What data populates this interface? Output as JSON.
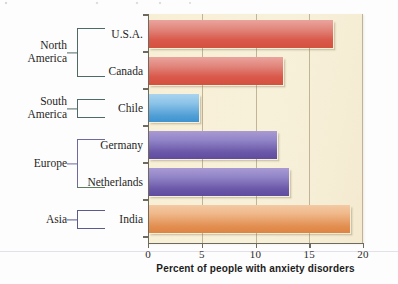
{
  "chart_data": {
    "type": "bar",
    "orientation": "horizontal",
    "title": "",
    "xlabel": "Percent of people with anxiety disorders",
    "ylabel": "",
    "xlim": [
      0,
      20
    ],
    "xticks": [
      0,
      5,
      10,
      15,
      20
    ],
    "xtick_labels": [
      "0",
      "5",
      "10",
      "15",
      "20"
    ],
    "grid": true,
    "grid_axis": "x",
    "legend": "none",
    "plot_background": "#f7efd5",
    "categories": [
      "U.S.A.",
      "Canada",
      "Chile",
      "Germany",
      "Netherlands",
      "India"
    ],
    "values": [
      17.2,
      12.6,
      4.7,
      12.0,
      13.1,
      18.8
    ],
    "bars": [
      {
        "label": "U.S.A.",
        "value": 17.2,
        "region": "North America",
        "color": "#d9584a"
      },
      {
        "label": "Canada",
        "value": 12.6,
        "region": "North America",
        "color": "#d9584a"
      },
      {
        "label": "Chile",
        "value": 4.7,
        "region": "South America",
        "color": "#4f9ed6"
      },
      {
        "label": "Germany",
        "value": 12.0,
        "region": "Europe",
        "color": "#6a57a8"
      },
      {
        "label": "Netherlands",
        "value": 13.1,
        "region": "Europe",
        "color": "#6a57a8"
      },
      {
        "label": "India",
        "value": 18.8,
        "region": "Asia",
        "color": "#e28f51"
      }
    ],
    "regions": [
      {
        "name": "North America",
        "line1": "North",
        "line2": "America",
        "members": [
          "U.S.A.",
          "Canada"
        ],
        "bracket_color": "#4e6a66"
      },
      {
        "name": "South America",
        "line1": "South",
        "line2": "America",
        "members": [
          "Chile"
        ],
        "bracket_color": "#4e6a66"
      },
      {
        "name": "Europe",
        "line1": "Europe",
        "line2": "",
        "members": [
          "Germany",
          "Netherlands"
        ],
        "bracket_color": "#6f6a9e"
      },
      {
        "name": "Asia",
        "line1": "Asia",
        "line2": "",
        "members": [
          "India"
        ],
        "bracket_color": "#5a5a8c"
      }
    ]
  },
  "axis": {
    "tick_0": "0",
    "tick_5": "5",
    "tick_10": "10",
    "tick_15": "15",
    "tick_20": "20",
    "title": "Percent of people with anxiety disorders"
  },
  "labels": {
    "usa": "U.S.A.",
    "canada": "Canada",
    "chile": "Chile",
    "germany": "Germany",
    "netherlands": "Netherlands",
    "india": "India"
  },
  "regions": {
    "north_america_line1": "North",
    "north_america_line2": "America",
    "south_america_line1": "South",
    "south_america_line2": "America",
    "europe": "Europe",
    "asia": "Asia"
  }
}
